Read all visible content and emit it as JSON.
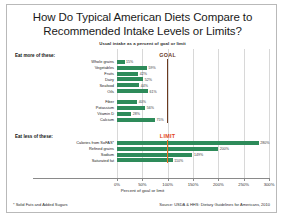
{
  "title": "How Do Typical American Diets Compare to Recommended Intake Levels or Limits?",
  "subtitle": "Usual intake as a percent of goal or limit",
  "footnote": "* Solid Fats and Added Sugars",
  "source": "Source: USDA & HHS: Dietary Guidelines for Americans, 2010",
  "colors": {
    "bar": "#2e8b5a",
    "goal_line": "#6b3a1f",
    "limit_line": "#ef6e1e",
    "goal_label": "#6b3a1f",
    "limit_label": "#e2451b",
    "grid": "#d8d8d8",
    "axis": "#8a8a8a",
    "frame": "#b9b9b9"
  },
  "groups": {
    "more_label": "Eat more of these:",
    "less_label": "Eat less of these:"
  },
  "reference_lines": {
    "goal": {
      "label": "GOAL",
      "value": 100
    },
    "limit": {
      "label": "LIMIT",
      "value": 100
    }
  },
  "chart_data": {
    "type": "bar",
    "orientation": "horizontal",
    "title": "How Do Typical American Diets Compare to Recommended Intake Levels or Limits?",
    "subtitle": "Usual intake as a percent of goal or limit",
    "xlabel": "Percent of goal or limit",
    "ylabel": "",
    "xlim": [
      0,
      300
    ],
    "grid": true,
    "legend": "none",
    "xticks": [
      0,
      50,
      100,
      150,
      200,
      250,
      300
    ],
    "xticklabels": [
      "0%",
      "50%",
      "100%",
      "150%",
      "200%",
      "250%",
      "300%"
    ],
    "groups": [
      {
        "name": "Eat more of these:",
        "reference_line": {
          "label": "GOAL",
          "value": 100,
          "color": "#6b3a1f"
        },
        "categories": [
          "Whole grains",
          "Vegetables",
          "Fruits",
          "Dairy",
          "Seafood",
          "Oils",
          "Fiber",
          "Potassium",
          "Vitamin D",
          "Calcium"
        ],
        "values": [
          15,
          59,
          42,
          52,
          44,
          61,
          40,
          56,
          28,
          75
        ],
        "value_labels": [
          "15%",
          "59%",
          "42%",
          "52%",
          "44%",
          "61%",
          "40%",
          "56%",
          "28%",
          "75%"
        ]
      },
      {
        "name": "Eat less of these:",
        "reference_line": {
          "label": "LIMIT",
          "value": 100,
          "color": "#ef6e1e"
        },
        "categories": [
          "Calories from SoFAS*",
          "Refined grains",
          "Sodium",
          "Saturated fat"
        ],
        "values": [
          280,
          200,
          149,
          110
        ],
        "value_labels": [
          "280%",
          "200%",
          "149%",
          "110%"
        ]
      }
    ]
  }
}
